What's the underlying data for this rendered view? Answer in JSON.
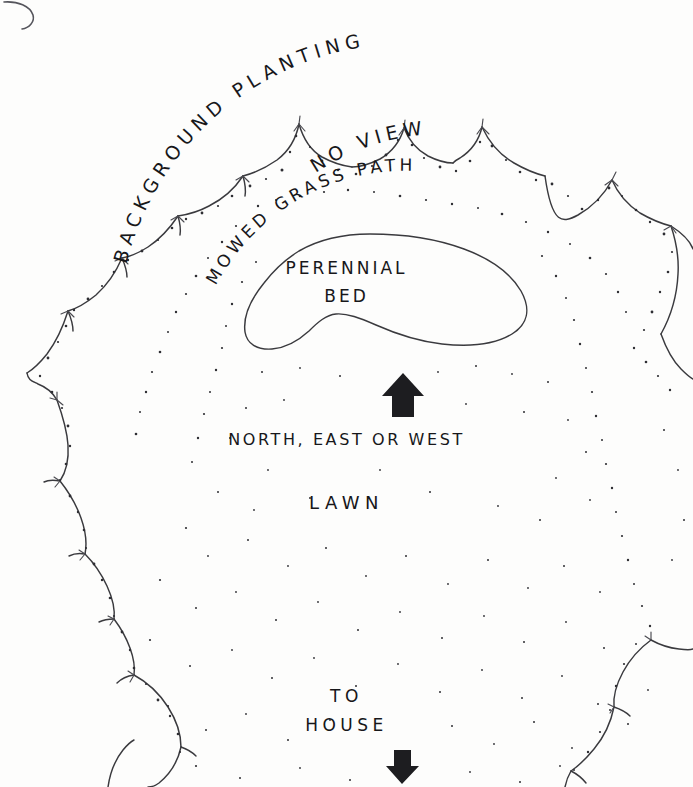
{
  "drawing": {
    "title": "Garden bed plan sketch",
    "paper_color": "#fdfdfc",
    "ink_color": "#3a3a3e"
  },
  "arc_labels": {
    "background_planting": "BACKGROUND   PLANTING",
    "no_view": "NO  VIEW",
    "mowed_grass_path": "MOWED   GRASS   PATH"
  },
  "bed": {
    "line1": "PERENNIAL",
    "line2": "BED"
  },
  "orientation": {
    "arrow_up": "up-arrow",
    "label": "NORTH, EAST OR WEST"
  },
  "lawn": {
    "label": "LAWN"
  },
  "house": {
    "line1": "TO",
    "line2": "HOUSE",
    "arrow_down": "down-arrow"
  }
}
